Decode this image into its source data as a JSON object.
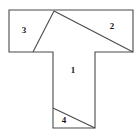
{
  "figure": {
    "background_color": "#ffffff",
    "stroke_color": "#4a4a4a",
    "fill_color": "#ffffff",
    "label_color": "#1a1a1a",
    "width": 140,
    "height": 136
  },
  "chart_data": {
    "type": "diagram",
    "outline_points": "9,10 133,10 133,52 95,52 95,128 53,128 53,52 9,52",
    "dividers": [
      {
        "name": "apex-to-left-edge",
        "x1": 54,
        "y1": 11,
        "x2": 33,
        "y2": 52
      },
      {
        "name": "apex-to-right-corner",
        "x1": 54,
        "y1": 11,
        "x2": 133,
        "y2": 52
      },
      {
        "name": "stem-lower-diagonal",
        "x1": 53,
        "y1": 108,
        "x2": 95,
        "y2": 128
      }
    ],
    "regions": [
      {
        "id": "region-1",
        "label": "1",
        "x": 73,
        "y": 71
      },
      {
        "id": "region-2",
        "label": "2",
        "x": 112,
        "y": 27
      },
      {
        "id": "region-3",
        "label": "3",
        "x": 24,
        "y": 31
      },
      {
        "id": "region-4",
        "label": "4",
        "x": 64,
        "y": 121
      }
    ]
  }
}
